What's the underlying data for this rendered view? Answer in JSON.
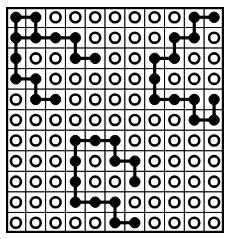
{
  "figure": {
    "kind": "lattice-dot-diagram",
    "title": "",
    "rows": 11,
    "cols": 11,
    "colors": {
      "background": "#ffffff",
      "grid_line": "#000000",
      "frame": "#000000",
      "filled_node": "#000000",
      "empty_node_fill": "#ffffff",
      "empty_node_stroke": "#000000",
      "link": "#000000"
    },
    "geometry": {
      "origin_x": 6,
      "origin_y": 7,
      "cell_size": 19.8,
      "node_radius_filled": 5.2,
      "node_radius_empty": 5.0
    },
    "legend": {
      "filled_symbol": "filled-circle",
      "empty_symbol": "open-circle"
    }
  },
  "chart_data": {
    "type": "heatmap",
    "title": "",
    "xlabel": "",
    "ylabel": "",
    "grid": true,
    "rows": 11,
    "cols": 11,
    "categories": [
      "c0",
      "c1",
      "c2",
      "c3",
      "c4",
      "c5",
      "c6",
      "c7",
      "c8",
      "c9",
      "c10"
    ],
    "row_labels": [
      "r0",
      "r1",
      "r2",
      "r3",
      "r4",
      "r5",
      "r6",
      "r7",
      "r8",
      "r9",
      "r10"
    ],
    "value_meaning": {
      "1": "filled black circle",
      "0": "open white circle"
    },
    "matrix": [
      [
        1,
        1,
        0,
        0,
        0,
        0,
        0,
        0,
        0,
        1,
        1
      ],
      [
        1,
        1,
        1,
        1,
        0,
        0,
        0,
        0,
        1,
        1,
        0
      ],
      [
        1,
        0,
        0,
        1,
        1,
        0,
        0,
        1,
        1,
        0,
        0
      ],
      [
        1,
        1,
        0,
        0,
        0,
        0,
        0,
        1,
        0,
        0,
        0
      ],
      [
        0,
        1,
        1,
        0,
        0,
        0,
        0,
        1,
        1,
        1,
        1
      ],
      [
        0,
        0,
        0,
        0,
        0,
        0,
        0,
        0,
        0,
        1,
        1
      ],
      [
        0,
        0,
        0,
        1,
        1,
        1,
        0,
        0,
        0,
        0,
        0
      ],
      [
        0,
        0,
        0,
        1,
        0,
        1,
        1,
        0,
        0,
        0,
        0
      ],
      [
        0,
        0,
        0,
        1,
        0,
        0,
        1,
        0,
        0,
        0,
        0
      ],
      [
        0,
        0,
        0,
        1,
        1,
        1,
        0,
        0,
        0,
        0,
        0
      ],
      [
        0,
        0,
        0,
        0,
        0,
        1,
        1,
        0,
        0,
        0,
        0
      ]
    ],
    "filled_count": 40,
    "empty_count": 81,
    "edges_horizontal": [
      [
        0,
        0,
        1
      ],
      [
        1,
        0,
        1
      ],
      [
        1,
        1,
        2
      ],
      [
        1,
        2,
        3
      ],
      [
        1,
        8,
        9
      ],
      [
        2,
        3,
        4
      ],
      [
        2,
        7,
        8
      ],
      [
        3,
        0,
        1
      ],
      [
        4,
        1,
        2
      ],
      [
        4,
        7,
        8
      ],
      [
        4,
        8,
        9
      ],
      [
        5,
        9,
        10
      ],
      [
        6,
        3,
        4
      ],
      [
        6,
        4,
        5
      ],
      [
        7,
        5,
        6
      ],
      [
        9,
        3,
        4
      ],
      [
        9,
        4,
        5
      ],
      [
        10,
        5,
        6
      ],
      [
        0,
        9,
        10
      ]
    ],
    "edges_vertical": [
      [
        0,
        1,
        0
      ],
      [
        1,
        2,
        0
      ],
      [
        2,
        3,
        0
      ],
      [
        0,
        1,
        1
      ],
      [
        1,
        2,
        3
      ],
      [
        3,
        4,
        1
      ],
      [
        0,
        1,
        9
      ],
      [
        1,
        2,
        8
      ],
      [
        2,
        3,
        7
      ],
      [
        3,
        4,
        7
      ],
      [
        4,
        5,
        9
      ],
      [
        4,
        5,
        10
      ],
      [
        6,
        7,
        3
      ],
      [
        7,
        8,
        3
      ],
      [
        8,
        9,
        3
      ],
      [
        6,
        7,
        5
      ],
      [
        7,
        8,
        6
      ],
      [
        9,
        10,
        5
      ]
    ]
  }
}
